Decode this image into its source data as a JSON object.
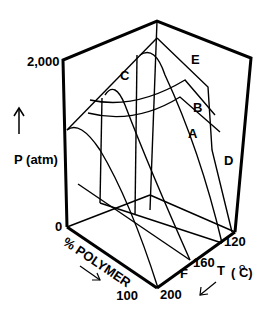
{
  "diagram": {
    "type": "3d-phase-diagram",
    "axes": {
      "pressure": {
        "label": "P  (atm)",
        "arrow": "up-arrow",
        "ticks": [
          "0",
          "2,000"
        ]
      },
      "composition": {
        "label": "% POLYMER",
        "arrow": "down-right-arrow",
        "ticks": [
          "0",
          "100"
        ]
      },
      "temperature": {
        "label": "T  (°C)",
        "unit_super": "O",
        "ticks": [
          "120",
          "160",
          "200"
        ]
      }
    },
    "curve_labels": [
      "A",
      "B",
      "C",
      "D",
      "E",
      "F"
    ]
  }
}
